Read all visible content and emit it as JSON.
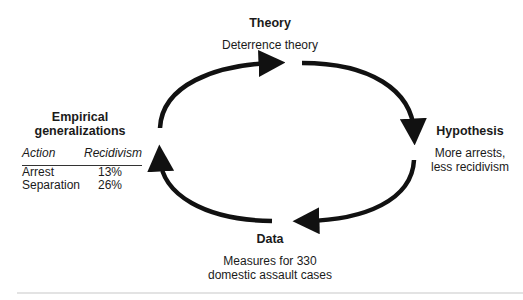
{
  "theory": {
    "title": "Theory",
    "text": "Deterrence theory"
  },
  "hypothesis": {
    "title": "Hypothesis",
    "line1": "More arrests,",
    "line2": "less recidivism"
  },
  "data": {
    "title": "Data",
    "line1": "Measures for 330",
    "line2": "domestic assault cases"
  },
  "empirical": {
    "title_line1": "Empirical",
    "title_line2": "generalizations",
    "columns": [
      "Action",
      "Recidivism"
    ],
    "rows": [
      {
        "action": "Arrest",
        "recidivism": "13%"
      },
      {
        "action": "Separation",
        "recidivism": "26%"
      }
    ]
  },
  "colors": {
    "arrow": "#111111",
    "text": "#1a1a1a",
    "rule": "#e3e3e3"
  }
}
